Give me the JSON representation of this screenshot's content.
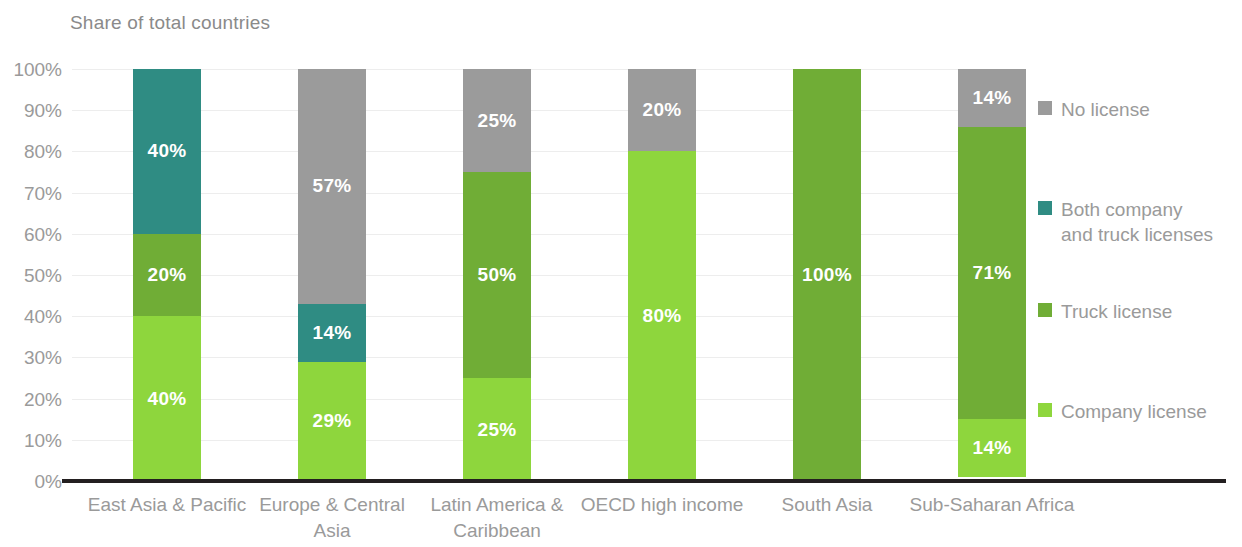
{
  "chart_data": {
    "type": "bar",
    "subtype": "stacked-bar-100",
    "title": "Share of total countries",
    "xlabel": "",
    "ylabel": "",
    "ylim": [
      0,
      100
    ],
    "ytick_labels": [
      "100%",
      "90%",
      "80%",
      "70%",
      "60%",
      "50%",
      "40%",
      "30%",
      "20%",
      "10%",
      "0%"
    ],
    "ytick_values": [
      100,
      90,
      80,
      70,
      60,
      50,
      40,
      30,
      20,
      10,
      0
    ],
    "grid": true,
    "legend_position": "right",
    "categories": [
      "East Asia & Pacific",
      "Europe & Central Asia",
      "Latin America & Caribbean",
      "OECD high income",
      "South Asia",
      "Sub-Saharan Africa"
    ],
    "series": [
      {
        "name": "Company license",
        "color": "#8ed63d",
        "values": [
          40,
          29,
          25,
          80,
          0,
          14
        ],
        "labels": [
          "40%",
          "29%",
          "25%",
          "80%",
          "",
          "14%"
        ]
      },
      {
        "name": "Truck license",
        "color": "#70ad36",
        "values": [
          20,
          0,
          50,
          0,
          100,
          71
        ],
        "labels": [
          "20%",
          "",
          "50%",
          "",
          "100%",
          "71%"
        ]
      },
      {
        "name": "Both company and truck licenses",
        "color": "#2f8c83",
        "values": [
          40,
          14,
          0,
          0,
          0,
          0
        ],
        "labels": [
          "40%",
          "14%",
          "",
          "",
          "",
          ""
        ]
      },
      {
        "name": "No license",
        "color": "#9b9b9b",
        "values": [
          0,
          57,
          25,
          20,
          0,
          14
        ],
        "labels": [
          "",
          "57%",
          "25%",
          "20%",
          "",
          "14%"
        ]
      }
    ]
  },
  "legend": {
    "items": [
      {
        "label": "No license",
        "color": "#9b9b9b",
        "top": 28
      },
      {
        "label": "Both company\nand truck licenses",
        "color": "#2f8c83",
        "top": 128
      },
      {
        "label": "Truck license",
        "color": "#70ad36",
        "top": 230
      },
      {
        "label": "Company license",
        "color": "#8ed63d",
        "top": 330
      }
    ]
  },
  "colors": {
    "axis_line": "#231f20",
    "gridline": "#ededed",
    "text_muted": "#9a9a9a",
    "title": "#8a8a8a",
    "label_on_bar": "#ffffff",
    "background": "#ffffff"
  }
}
